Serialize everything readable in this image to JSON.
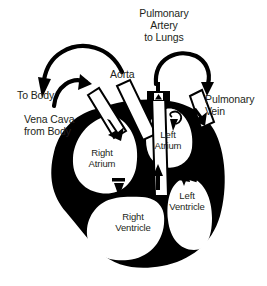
{
  "diagram": {
    "type": "anatomical-schematic",
    "colors": {
      "muscle": "#000000",
      "chamber": "#ffffff",
      "background": "#ffffff",
      "text": "#231f20",
      "vessel_outline": "#000000"
    },
    "external_labels": [
      {
        "id": "pulmonary-artery",
        "text": "Pulmonary\nArtery\nto Lungs",
        "align": "center",
        "x": 162,
        "y": 8
      },
      {
        "id": "aorta",
        "text": "Aorta",
        "align": "left",
        "x": 110,
        "y": 69
      },
      {
        "id": "to-body",
        "text": "To Body",
        "align": "left",
        "x": 17,
        "y": 90
      },
      {
        "id": "pulmonary-vein",
        "text": "Pulmonary\nVein",
        "align": "left",
        "x": 205,
        "y": 94
      },
      {
        "id": "vena-cava",
        "text": "Vena Cava\nfrom Body",
        "align": "left",
        "x": 24,
        "y": 114
      }
    ],
    "chamber_labels": [
      {
        "id": "right-atrium",
        "text": "Right\nAtrium",
        "x": 101,
        "y": 148
      },
      {
        "id": "left-atrium",
        "text": "Left\nAtrium",
        "x": 167,
        "y": 133
      },
      {
        "id": "left-ventricle",
        "text": "Left\nVentricle",
        "x": 179,
        "y": 190
      },
      {
        "id": "right-ventricle",
        "text": "Right\nVentricle",
        "x": 130,
        "y": 211
      }
    ],
    "vessels": [
      {
        "id": "aorta-tube",
        "label": "Aorta",
        "flow": "out"
      },
      {
        "id": "vena-cava-tube",
        "label": "Vena Cava from Body",
        "flow": "in"
      },
      {
        "id": "pulmonary-artery-tube",
        "label": "Pulmonary Artery to Lungs",
        "flow": "out"
      },
      {
        "id": "pulmonary-vein-tube",
        "label": "Pulmonary Vein",
        "flow": "in"
      }
    ],
    "flow_arrows": [
      {
        "id": "arc-to-body",
        "from": "aorta",
        "to": "To Body"
      },
      {
        "id": "arc-vena-cava",
        "from": "body",
        "to": "Vena Cava"
      },
      {
        "id": "arc-pulmonary",
        "from": "Pulmonary Artery",
        "to": "Pulmonary Vein"
      },
      {
        "id": "valve-tricuspid",
        "from": "Right Atrium",
        "to": "Right Ventricle"
      },
      {
        "id": "valve-mitral",
        "from": "Left Atrium",
        "to": "Left Ventricle"
      }
    ]
  }
}
